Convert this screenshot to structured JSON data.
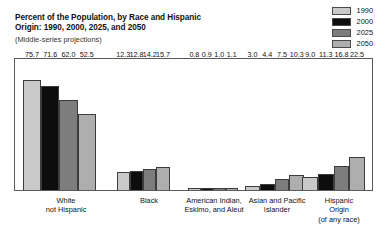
{
  "title": {
    "line1": "Percent of the Population, by Race and Hispanic",
    "line2": "Origin: 1990, 2000, 2025, and 2050",
    "subtitle": "(Middle-series projections)"
  },
  "legend": {
    "position": "top-right",
    "entries": [
      {
        "label": "1990",
        "color": "#c9c9c9"
      },
      {
        "label": "2000",
        "color": "#0d0d0d"
      },
      {
        "label": "2025",
        "color": "#7d7d7d"
      },
      {
        "label": "2050",
        "color": "#aeaeae"
      }
    ]
  },
  "chart_data": {
    "type": "bar",
    "title": "Percent of the Population, by Race and Hispanic Origin: 1990, 2000, 2025, and 2050",
    "subtitle": "(Middle-series projections)",
    "xlabel": "",
    "ylabel": "",
    "ylim": [
      0,
      80
    ],
    "grid": false,
    "legend_position": "top-right",
    "categories": [
      "White not Hispanic",
      "Black",
      "American Indian, Eskimo, and Aleut",
      "Asian and Pacific Islander",
      "Hispanic Origin (of any race)"
    ],
    "category_lines": [
      [
        "White",
        "not Hispanic"
      ],
      [
        "Black"
      ],
      [
        "American Indian,",
        "Eskimo, and Aleut"
      ],
      [
        "Asian and Pacific",
        "Islander"
      ],
      [
        "Hispanic",
        "Origin",
        "(of any race)"
      ]
    ],
    "series": [
      {
        "name": "1990",
        "color": "#c9c9c9",
        "values": [
          75.7,
          12.3,
          0.8,
          3.0,
          9.0
        ]
      },
      {
        "name": "2000",
        "color": "#0d0d0d",
        "values": [
          71.6,
          12.8,
          0.9,
          4.4,
          11.3
        ]
      },
      {
        "name": "2025",
        "color": "#7d7d7d",
        "values": [
          62.0,
          14.2,
          1.0,
          7.5,
          16.8
        ]
      },
      {
        "name": "2050",
        "color": "#aeaeae",
        "values": [
          52.5,
          15.7,
          1.1,
          10.3,
          22.5
        ]
      }
    ],
    "value_labels": [
      [
        "75.7",
        "71.6",
        "62.0",
        "52.5"
      ],
      [
        "12.3",
        "12.8",
        "14.2",
        "15.7"
      ],
      [
        "0.8",
        "0.9",
        "1.0",
        "1.1"
      ],
      [
        "3.0",
        "4.4",
        "7.5",
        "10.3"
      ],
      [
        "9.0",
        "11.3",
        "16.8",
        "22.5"
      ]
    ]
  },
  "layout": {
    "group_left_pct": [
      2.2,
      28.5,
      48.5,
      64.5,
      80.5
    ],
    "group_width_pct": [
      20.5,
      14.8,
      14.0,
      16.5,
      17.5
    ],
    "label_left_px": [
      22,
      110,
      165,
      228,
      290
    ],
    "label_width_px": [
      60,
      50,
      70,
      70,
      70
    ],
    "y_max": 80
  }
}
